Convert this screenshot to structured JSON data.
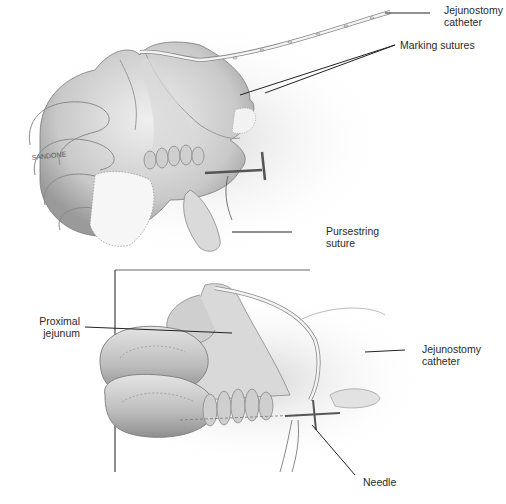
{
  "figure": {
    "type": "surgical-illustration",
    "panels": [
      {
        "id": "top",
        "labels": [
          {
            "key": "jejunostomy_catheter_top",
            "lines": [
              "Jejunostomy",
              "catheter"
            ]
          },
          {
            "key": "marking_sutures",
            "lines": [
              "Marking sutures"
            ]
          },
          {
            "key": "pursestring_suture",
            "lines": [
              "Pursestring",
              "suture"
            ]
          }
        ],
        "signature": "SANDONE"
      },
      {
        "id": "bottom",
        "labels": [
          {
            "key": "proximal_jejunum",
            "lines": [
              "Proximal",
              "jejunum"
            ]
          },
          {
            "key": "jejunostomy_catheter_bottom",
            "lines": [
              "Jejunostomy",
              "catheter"
            ]
          },
          {
            "key": "needle",
            "lines": [
              "Needle"
            ]
          }
        ]
      }
    ]
  },
  "labels": {
    "jej_cath_top_1": "Jejunostomy",
    "jej_cath_top_2": "catheter",
    "marking_sutures": "Marking sutures",
    "pursestring_1": "Pursestring",
    "pursestring_2": "suture",
    "proximal_1": "Proximal",
    "proximal_2": "jejunum",
    "jej_cath_bot_1": "Jejunostomy",
    "jej_cath_bot_2": "catheter",
    "needle": "Needle",
    "signature": "SANDONE"
  },
  "colors": {
    "ink": "#222222",
    "bowel_light": "#e6e6e6",
    "bowel_mid": "#bdbdbd",
    "bowel_dark": "#8a8a8a",
    "background": "#ffffff"
  }
}
